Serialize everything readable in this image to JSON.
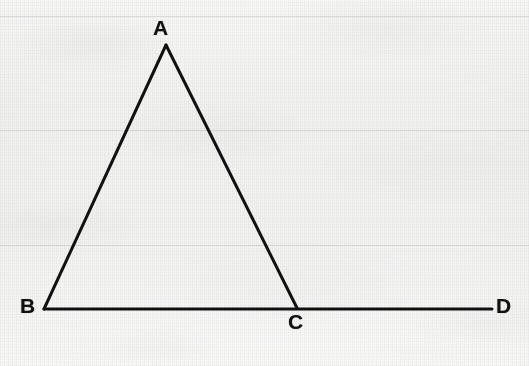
{
  "figure": {
    "kind": "geometry-diagram",
    "background_color": "#ececea",
    "ink_color": "#111111",
    "stroke_width_px": 3,
    "canvas": {
      "width": 529,
      "height": 366
    },
    "labels": [
      {
        "id": "A",
        "text": "A",
        "vertex": "apex"
      },
      {
        "id": "B",
        "text": "B",
        "vertex": "bottom-left"
      },
      {
        "id": "C",
        "text": "C",
        "vertex": "bottom-right-of-triangle"
      },
      {
        "id": "D",
        "text": "D",
        "vertex": "end-of-extended-base"
      }
    ],
    "points": {
      "A": {
        "x": 166,
        "y": 45
      },
      "B": {
        "x": 44,
        "y": 309
      },
      "C": {
        "x": 297,
        "y": 308
      },
      "D": {
        "x": 492,
        "y": 309
      }
    },
    "segments": [
      {
        "name": "AB",
        "from": "A",
        "to": "B"
      },
      {
        "name": "AC",
        "from": "A",
        "to": "C"
      },
      {
        "name": "BD",
        "from": "B",
        "to": "D"
      }
    ],
    "scan_lines_y": [
      16,
      130,
      245
    ]
  }
}
